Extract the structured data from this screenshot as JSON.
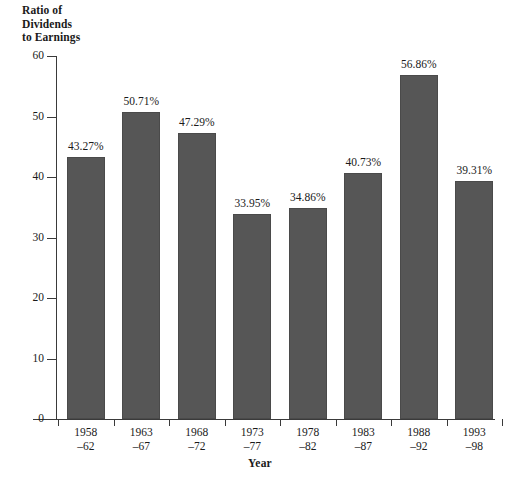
{
  "chart_data": {
    "type": "bar",
    "title": "",
    "ylabel": "Ratio of Dividends to Earnings",
    "xlabel": "Year",
    "categories": [
      "1958–62",
      "1963–67",
      "1968–72",
      "1973–77",
      "1978–82",
      "1983–87",
      "1988–92",
      "1993–98"
    ],
    "values": [
      43.27,
      50.71,
      47.29,
      33.95,
      34.86,
      40.73,
      56.86,
      39.31
    ],
    "data_labels": [
      "43.27%",
      "50.71%",
      "47.29%",
      "33.95%",
      "34.86%",
      "40.73%",
      "56.86%",
      "39.31%"
    ],
    "ylim": [
      0,
      60
    ],
    "yticks": [
      0,
      10,
      20,
      30,
      40,
      50,
      60
    ],
    "ytick_labels": [
      "0",
      "10",
      "20",
      "30",
      "40",
      "50",
      "60"
    ],
    "grid": false,
    "legend": false,
    "bar_color": "#565656",
    "bar_edge_color": "#4a4a4a",
    "axis_color": "#3a3a3a",
    "background": "#ffffff"
  },
  "y_axis": {
    "title_lines": [
      "Ratio of",
      "Dividends",
      "to Earnings"
    ]
  },
  "x_axis": {
    "title": "Year",
    "categories": [
      {
        "line1": "1958",
        "line2": "–62"
      },
      {
        "line1": "1963",
        "line2": "–67"
      },
      {
        "line1": "1968",
        "line2": "–72"
      },
      {
        "line1": "1973",
        "line2": "–77"
      },
      {
        "line1": "1978",
        "line2": "–82"
      },
      {
        "line1": "1983",
        "line2": "–87"
      },
      {
        "line1": "1988",
        "line2": "–92"
      },
      {
        "line1": "1993",
        "line2": "–98"
      }
    ]
  }
}
